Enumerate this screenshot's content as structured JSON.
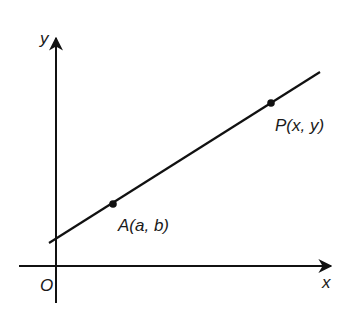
{
  "diagram": {
    "type": "coordinate-plane-line",
    "axes": {
      "x_label": "x",
      "y_label": "y",
      "origin_label": "O"
    },
    "points": [
      {
        "name": "A",
        "label": "A(a, b)"
      },
      {
        "name": "P",
        "label": "P(x, y)"
      }
    ],
    "colors": {
      "stroke": "#111111",
      "background": "#ffffff"
    }
  }
}
